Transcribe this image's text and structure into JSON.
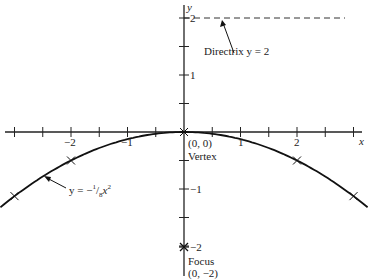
{
  "chart_data": {
    "type": "line",
    "title": "",
    "xlabel": "x",
    "ylabel": "y",
    "xlim": [
      -3.25,
      3.25
    ],
    "ylim": [
      -2.2,
      2.3
    ],
    "x_ticks": [
      -3,
      -2.5,
      -2,
      -1.5,
      -1,
      -0.5,
      0.5,
      1,
      1.5,
      2,
      2.5,
      3
    ],
    "x_tick_labels": [
      "-2",
      "-1",
      "1",
      "2"
    ],
    "y_tick_labels": [
      "2",
      "1",
      "-1",
      "-2"
    ],
    "series": [
      {
        "name": "y = -1/8 x^2",
        "equation": "y = -(1/8)x^2",
        "x": [
          -3.25,
          -3,
          -2.5,
          -2,
          -1.5,
          -1,
          -0.5,
          0,
          0.5,
          1,
          1.5,
          2,
          2.5,
          3,
          3.25
        ],
        "y": [
          -1.32,
          -1.125,
          -0.781,
          -0.5,
          -0.281,
          -0.125,
          -0.031,
          0,
          -0.031,
          -0.125,
          -0.281,
          -0.5,
          -0.781,
          -1.125,
          -1.32
        ]
      }
    ],
    "marked_points": [
      {
        "x": -3,
        "y": -1.125
      },
      {
        "x": -2,
        "y": -0.5
      },
      {
        "x": 0,
        "y": 0
      },
      {
        "x": 2,
        "y": -0.5
      },
      {
        "x": 3,
        "y": -1.125
      }
    ],
    "directrix": {
      "y": 2,
      "style": "dashed"
    },
    "annotations": [
      {
        "text": "Directrix y = 2"
      },
      {
        "text": "(0, 0)"
      },
      {
        "text": "Vertex"
      },
      {
        "text": "y = -1/8 x^2"
      },
      {
        "text": "Focus"
      },
      {
        "text": "(0, -2)"
      }
    ],
    "grid": false
  },
  "labels": {
    "x_axis": "x",
    "y_axis": "y",
    "tick_x_neg2": "−2",
    "tick_x_neg1": "−1",
    "tick_x_1": "1",
    "tick_x_2": "2",
    "tick_y_2": "2",
    "tick_y_1": "1",
    "tick_y_neg1": "−1",
    "tick_y_neg2": "−2",
    "directrix": "Directrix y = 2",
    "vertex_coords": "(0, 0)",
    "vertex": "Vertex",
    "curve_eq_prefix": "y = −",
    "curve_eq_num": "1",
    "curve_eq_den": "8",
    "curve_eq_var": "x",
    "curve_eq_exp": "2",
    "focus": "Focus",
    "focus_coords": "(0, −2)"
  }
}
